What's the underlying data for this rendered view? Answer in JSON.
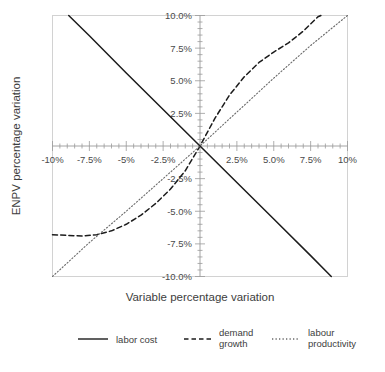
{
  "chart_data": {
    "type": "line",
    "title": "",
    "xlabel": "Variable percentage variation",
    "ylabel": "ENPV percentage variation",
    "xlim": [
      -10,
      10
    ],
    "ylim": [
      -10,
      10
    ],
    "grid": false,
    "legend_position": "bottom",
    "x_tick_labels": [
      "-10%",
      "-7.5%",
      "-5%",
      "-2.5%",
      "2.5%",
      "5.0%",
      "7.5%",
      "10%"
    ],
    "x_tick_values": [
      -10,
      -7.5,
      -5,
      -2.5,
      2.5,
      5,
      7.5,
      10
    ],
    "y_tick_labels": [
      "10.0%",
      "7.5%",
      "5.0%",
      "2.5%",
      "-2.5%",
      "-5.0%",
      "-7.5%",
      "-10.0%"
    ],
    "y_tick_values": [
      10,
      7.5,
      5,
      2.5,
      -2.5,
      -5,
      -7.5,
      -10
    ],
    "minor_ticks_per_interval": 5,
    "series": [
      {
        "name": "labor cost",
        "style": "solid",
        "color": "#1c1c1c",
        "x": [
          -8.9,
          -7.5,
          -5,
          -2.5,
          0,
          2.5,
          5,
          7.5,
          8.9
        ],
        "values": [
          10,
          8.45,
          5.6,
          2.8,
          0,
          -2.8,
          -5.6,
          -8.4,
          -10
        ]
      },
      {
        "name": "demand growth",
        "style": "dashed",
        "color": "#1c1c1c",
        "x": [
          -10,
          -9,
          -8,
          -7,
          -6,
          -5,
          -4,
          -3,
          -2,
          -1,
          0,
          1,
          2,
          3,
          4,
          5,
          6,
          7,
          8,
          8.2
        ],
        "values": [
          -6.8,
          -6.85,
          -6.9,
          -6.8,
          -6.5,
          -6.0,
          -5.3,
          -4.4,
          -3.3,
          -1.9,
          0,
          2.1,
          3.9,
          5.3,
          6.4,
          7.2,
          7.9,
          8.8,
          9.9,
          10
        ]
      },
      {
        "name": "labour productivity",
        "style": "dotted",
        "color": "#6a6a6a",
        "x": [
          -10,
          -7.5,
          -5,
          -2.5,
          0,
          2.5,
          5,
          7.5,
          10
        ],
        "values": [
          -10,
          -7.4,
          -5.0,
          -2.5,
          0,
          2.6,
          5.2,
          7.7,
          10
        ]
      }
    ]
  },
  "legend": {
    "items": [
      {
        "label_line1": "labor cost",
        "label_line2": "",
        "style": "solid"
      },
      {
        "label_line1": "demand",
        "label_line2": "growth",
        "style": "dashed"
      },
      {
        "label_line1": "labour",
        "label_line2": "productivity",
        "style": "dotted"
      }
    ]
  },
  "colors": {
    "frame": "#d2d2d2",
    "axis": "#9a9a9a",
    "solid_series": "#1c1c1c",
    "dashed_series": "#1c1c1c",
    "dotted_series": "#6a6a6a",
    "text": "#3d3d3d",
    "background": "#ffffff"
  }
}
